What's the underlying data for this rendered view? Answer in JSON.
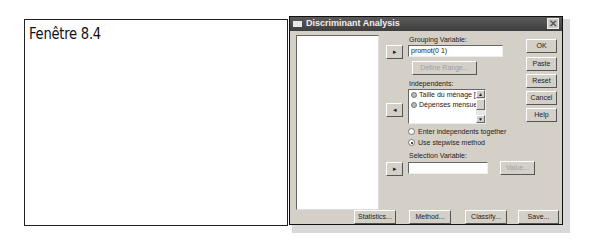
{
  "caption": {
    "text": "Fenêtre 8.4"
  },
  "dialog": {
    "title": "Discriminant Analysis",
    "close_glyph": "✕",
    "grouping": {
      "label": "Grouping Variable:",
      "value": "promot(0 1)",
      "move_glyph": "▸",
      "define_range_label": "Define Range..."
    },
    "independents": {
      "label": "Independents:",
      "move_glyph": "◂",
      "items": [
        {
          "label": "Taille du ménage [t"
        },
        {
          "label": "Dépenses mensuel"
        }
      ],
      "scroll_up_glyph": "▲",
      "scroll_down_glyph": "▼"
    },
    "method": {
      "options": [
        {
          "label": "Enter independents together",
          "selected": false
        },
        {
          "label": "Use stepwise method",
          "selected": true
        }
      ]
    },
    "selection": {
      "label": "Selection Variable:",
      "value": "",
      "move_glyph": "▸",
      "value_button_label": "Value..."
    },
    "side_buttons": {
      "ok": "OK",
      "paste": "Paste",
      "reset": "Reset",
      "cancel": "Cancel",
      "help": "Help"
    },
    "bottom_buttons": {
      "statistics": "Statistics...",
      "method": "Method...",
      "classify": "Classify...",
      "save": "Save..."
    }
  }
}
